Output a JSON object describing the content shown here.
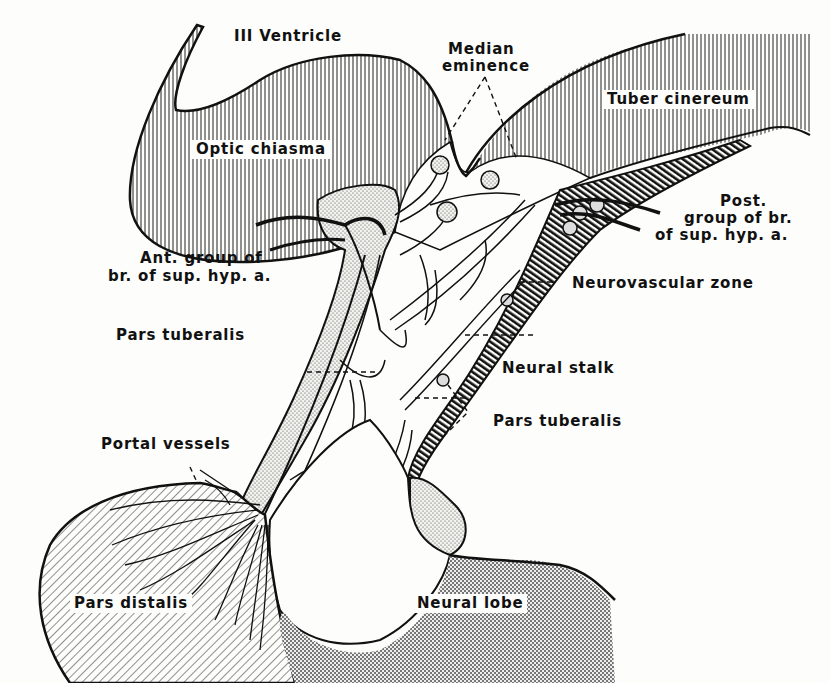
{
  "figure": {
    "labels": {
      "third_ventricle": "III Ventricle",
      "median_eminence_1": "Median",
      "median_eminence_2": "eminence",
      "tuber_cinereum": "Tuber cinereum",
      "optic_chiasma": "Optic chiasma",
      "post_group_1": "Post.",
      "post_group_2": "group of br.",
      "post_group_3": "of sup. hyp. a.",
      "ant_group_1": "Ant. group of",
      "ant_group_2": "br. of sup. hyp. a.",
      "neurovascular_zone": "Neurovascular zone",
      "pars_tuberalis_left": "Pars  tuberalis",
      "neural_stalk": "Neural  stalk",
      "pars_tuberalis_right": "Pars  tuberalis",
      "portal_vessels": "Portal vessels",
      "pars_distalis": "Pars distalis",
      "neural_lobe": "Neural   lobe"
    },
    "colors": {
      "ink": "#111111",
      "paper": "#fdfdfb"
    }
  }
}
